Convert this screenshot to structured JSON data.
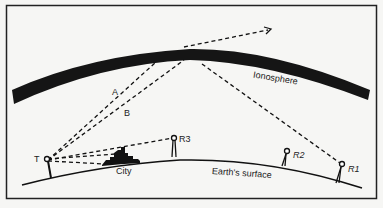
{
  "diagram": {
    "labels": {
      "ionosphere": "Ionosphere",
      "earth_surface": "Earth's surface",
      "city": "City",
      "transmitter": "T",
      "receiver_1": "R1",
      "receiver_2": "R2",
      "receiver_3": "R3",
      "ray_a": "A",
      "ray_b": "B"
    },
    "elements": [
      {
        "id": "T",
        "type": "transmitter antenna",
        "position": "left on surface"
      },
      {
        "id": "R1",
        "type": "receiver antenna",
        "position": "far right, reached by skywave reflection"
      },
      {
        "id": "R2",
        "type": "receiver antenna",
        "position": "right, in skip zone"
      },
      {
        "id": "R3",
        "type": "receiver antenna",
        "position": "center-left, line-of-sight beyond city"
      },
      {
        "id": "City",
        "type": "buildings silhouette",
        "position": "between T and R3"
      }
    ],
    "rays": [
      {
        "name": "A",
        "from": "T",
        "to": "ionosphere",
        "behavior": "penetrates ionosphere and escapes to space"
      },
      {
        "name": "B",
        "from": "T",
        "to": "ionosphere",
        "behavior": "reflected down to R1"
      },
      {
        "name": "direct-R3",
        "from": "T",
        "to": "R3"
      },
      {
        "name": "direct-city",
        "from": "T",
        "to": "City"
      }
    ],
    "colors": {
      "ink": "#111111",
      "background": "#f6f6f4"
    }
  }
}
